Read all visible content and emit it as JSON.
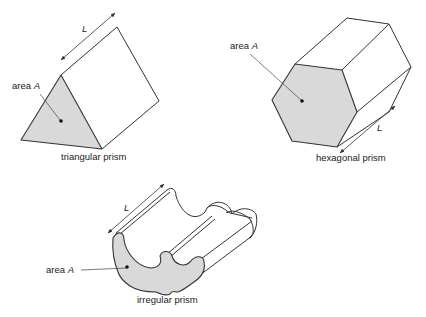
{
  "figure": {
    "shapes": [
      {
        "id": "triangular",
        "caption": "triangular prism",
        "area_label": "area",
        "area_symbol": "A",
        "length_symbol": "L"
      },
      {
        "id": "hexagonal",
        "caption": "hexagonal prism",
        "area_label": "area",
        "area_symbol": "A",
        "length_symbol": "L"
      },
      {
        "id": "irregular",
        "caption": "irregular prism",
        "area_label": "area",
        "area_symbol": "A",
        "length_symbol": "L"
      }
    ],
    "colors": {
      "face_fill": "#d9d9d9",
      "edge_stroke": "#333333",
      "background": "#ffffff"
    }
  }
}
